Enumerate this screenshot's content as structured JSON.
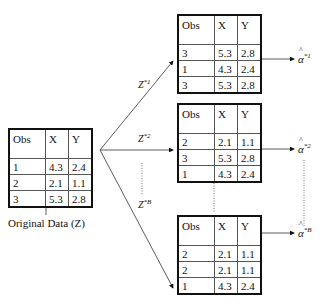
{
  "original": {
    "caption": "Original Data (Z)",
    "headers": [
      "Obs",
      "X",
      "Y"
    ],
    "rows": [
      [
        "1",
        "4.3",
        "2.4"
      ],
      [
        "2",
        "2.1",
        "1.1"
      ],
      [
        "3",
        "5.3",
        "2.8"
      ]
    ]
  },
  "samples": [
    {
      "edge_label": "Z",
      "edge_sup": "*1",
      "estimate": "α",
      "estimate_sup": "*1",
      "headers": [
        "Obs",
        "X",
        "Y"
      ],
      "rows": [
        [
          "3",
          "5.3",
          "2.8"
        ],
        [
          "1",
          "4.3",
          "2.4"
        ],
        [
          "3",
          "5.3",
          "2.8"
        ]
      ]
    },
    {
      "edge_label": "Z",
      "edge_sup": "*2",
      "estimate": "α",
      "estimate_sup": "*2",
      "headers": [
        "Obs",
        "X",
        "Y"
      ],
      "rows": [
        [
          "2",
          "2.1",
          "1.1"
        ],
        [
          "3",
          "5.3",
          "2.8"
        ],
        [
          "1",
          "4.3",
          "2.4"
        ]
      ]
    },
    {
      "edge_label": "Z",
      "edge_sup": "*B",
      "estimate": "α",
      "estimate_sup": "*B",
      "headers": [
        "Obs",
        "X",
        "Y"
      ],
      "rows": [
        [
          "2",
          "2.1",
          "1.1"
        ],
        [
          "2",
          "2.1",
          "1.1"
        ],
        [
          "1",
          "4.3",
          "2.4"
        ]
      ]
    }
  ],
  "hat_glyph": "^"
}
